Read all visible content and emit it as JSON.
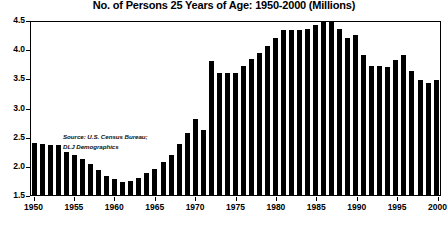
{
  "chart_data": {
    "type": "bar",
    "title": "No. of Persons 25 Years of Age: 1950-2000 (Millions)",
    "xlabel": "",
    "ylabel": "",
    "ylim": [
      1.5,
      4.5
    ],
    "ytick_step": 0.5,
    "yticks": [
      "4.5",
      "4.0",
      "3.5",
      "3.0",
      "2.5",
      "2.0",
      "1.5"
    ],
    "xticks": [
      "1950",
      "1955",
      "1960",
      "1965",
      "1970",
      "1975",
      "1980",
      "1985",
      "1990",
      "1995",
      "2000"
    ],
    "grid": false,
    "legend": "none",
    "bar_color": "#000000",
    "annotation": "Source: U.S. Census Bureau;\nDLJ Demographics",
    "categories": [
      "1950",
      "1951",
      "1952",
      "1953",
      "1954",
      "1955",
      "1956",
      "1957",
      "1958",
      "1959",
      "1960",
      "1961",
      "1962",
      "1963",
      "1964",
      "1965",
      "1966",
      "1967",
      "1968",
      "1969",
      "1970",
      "1971",
      "1972",
      "1973",
      "1974",
      "1975",
      "1976",
      "1977",
      "1978",
      "1979",
      "1980",
      "1981",
      "1982",
      "1983",
      "1984",
      "1985",
      "1986",
      "1987",
      "1988",
      "1989",
      "1990",
      "1991",
      "1992",
      "1993",
      "1994",
      "1995",
      "1996",
      "1997",
      "1998",
      "1999",
      "2000"
    ],
    "values": [
      2.39,
      2.37,
      2.36,
      2.35,
      2.24,
      2.18,
      2.12,
      2.04,
      1.93,
      1.82,
      1.77,
      1.72,
      1.74,
      1.8,
      1.87,
      1.95,
      2.06,
      2.19,
      2.37,
      2.56,
      2.8,
      2.62,
      3.8,
      3.6,
      3.6,
      3.6,
      3.72,
      3.84,
      3.94,
      4.06,
      4.2,
      4.33,
      4.33,
      4.33,
      4.35,
      4.42,
      4.47,
      4.47,
      4.34,
      4.2,
      4.24,
      3.9,
      3.72,
      3.72,
      3.7,
      3.81,
      3.9,
      3.62,
      3.47,
      3.42,
      3.48
    ]
  }
}
